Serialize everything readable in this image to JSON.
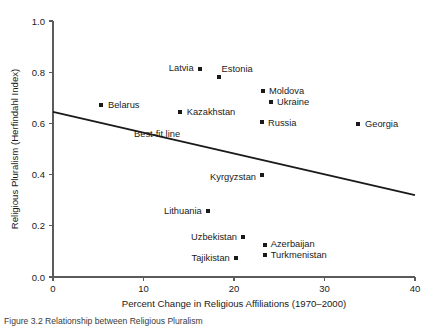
{
  "chart_data": {
    "type": "scatter",
    "title": "",
    "xlabel": "Percent Change in Religious Affiliations (1970–2000)",
    "ylabel": "Religious Pluralism (Herfindahl Index)",
    "xlim": [
      0,
      40
    ],
    "ylim": [
      0.0,
      1.0
    ],
    "xticks": [
      "0",
      "10",
      "20",
      "30",
      "40"
    ],
    "xtick_values": [
      0,
      10,
      20,
      30,
      40
    ],
    "yticks": [
      "0.0",
      "0.2",
      "0.4",
      "0.6",
      "0.8",
      "1.0"
    ],
    "ytick_values": [
      0.0,
      0.2,
      0.4,
      0.6,
      0.8,
      1.0
    ],
    "grid": false,
    "legend": "none",
    "marker_color": "#1a1a1a",
    "marker_shape": "square",
    "points": [
      {
        "name": "Belarus",
        "x": 5.3,
        "y": 0.672,
        "label_side": "right",
        "label_dx": 7,
        "label_dy": 3.4
      },
      {
        "name": "Latvia",
        "x": 16.2,
        "y": 0.813,
        "label_side": "left",
        "label_dx": -6,
        "label_dy": 2.2
      },
      {
        "name": "Estonia",
        "x": 18.3,
        "y": 0.781,
        "label_side": "right",
        "label_dx": 3,
        "label_dy": -5.5
      },
      {
        "name": "Kazakhstan",
        "x": 14.0,
        "y": 0.645,
        "label_side": "right",
        "label_dx": 7,
        "label_dy": 3.4
      },
      {
        "name": "Moldova",
        "x": 23.2,
        "y": 0.727,
        "label_side": "right",
        "label_dx": 6,
        "label_dy": 2.8
      },
      {
        "name": "Ukraine",
        "x": 24.1,
        "y": 0.684,
        "label_side": "right",
        "label_dx": 6,
        "label_dy": 3.4
      },
      {
        "name": "Russia",
        "x": 23.1,
        "y": 0.605,
        "label_side": "right",
        "label_dx": 6,
        "label_dy": 3.4
      },
      {
        "name": "Georgia",
        "x": 33.7,
        "y": 0.598,
        "label_side": "right",
        "label_dx": 7,
        "label_dy": 3.4
      },
      {
        "name": "Kyrgyzstan",
        "x": 23.1,
        "y": 0.398,
        "label_side": "left",
        "label_dx": -6,
        "label_dy": 5.0
      },
      {
        "name": "Lithuania",
        "x": 17.1,
        "y": 0.258,
        "label_side": "left",
        "label_dx": -6,
        "label_dy": 3.4
      },
      {
        "name": "Uzbekistan",
        "x": 21.0,
        "y": 0.156,
        "label_side": "left",
        "label_dx": -6,
        "label_dy": 3.4
      },
      {
        "name": "Azerbaijan",
        "x": 23.4,
        "y": 0.125,
        "label_side": "right",
        "label_dx": 6,
        "label_dy": 2.0
      },
      {
        "name": "Turkmenistan",
        "x": 23.4,
        "y": 0.086,
        "label_side": "right",
        "label_dx": 6,
        "label_dy": 3.4
      },
      {
        "name": "Tajikistan",
        "x": 20.2,
        "y": 0.074,
        "label_side": "left",
        "label_dx": -6,
        "label_dy": 3.4
      }
    ],
    "best_fit_line": {
      "label": "Best-fit line",
      "x0": 0,
      "y0": 0.645,
      "x1": 40,
      "y1": 0.32,
      "label_x": 11.5,
      "label_y": 0.545
    }
  },
  "caption": {
    "text": "Figure 3.2  Relationship between Religious Pluralism"
  }
}
